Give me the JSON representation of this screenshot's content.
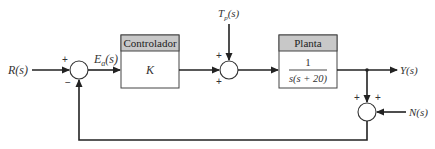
{
  "diagram": {
    "type": "closed-loop block diagram",
    "signals": {
      "input": "R(s)",
      "error": "Ea(s)",
      "disturbance": "Tp(s)",
      "output": "Y(s)",
      "noise": "N(s)"
    },
    "blocks": {
      "controller": {
        "header": "Controlador",
        "body": "K"
      },
      "plant": {
        "header": "Planta",
        "numerator": "1",
        "denominator": "s(s + 20)"
      }
    },
    "junctions": {
      "error_sum": {
        "signs": [
          "+",
          "−"
        ]
      },
      "disturbance_sum": {
        "signs": [
          "+",
          "+"
        ]
      },
      "noise_sum": {
        "signs": [
          "+",
          "+"
        ]
      }
    }
  }
}
